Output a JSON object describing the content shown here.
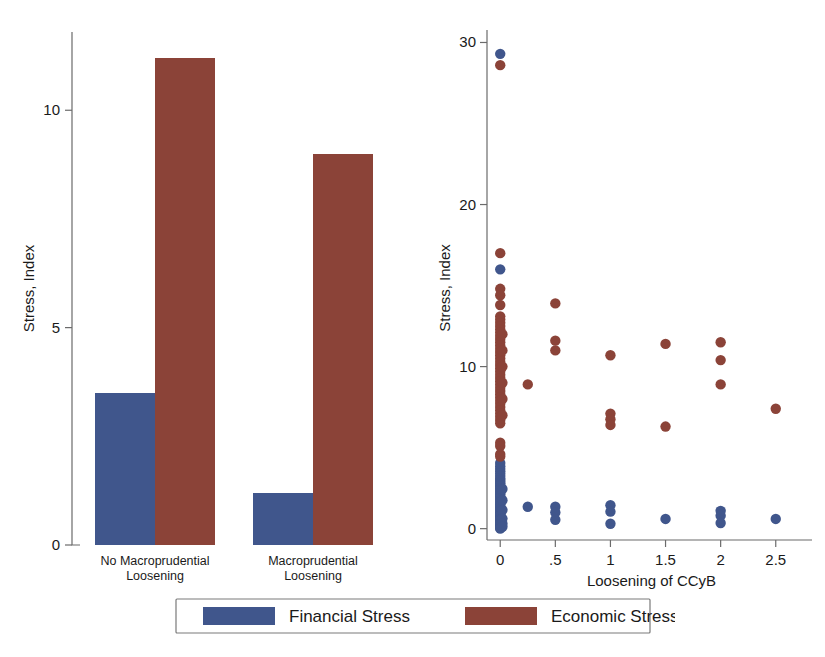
{
  "colors": {
    "financial": "#40568c",
    "economic": "#8b4338",
    "axis": "#6b6b6b",
    "text": "#1a1a1a",
    "background": "#ffffff",
    "legend_border": "#7a7a7a"
  },
  "legend": {
    "position": "bottom-center",
    "entries": [
      {
        "label": "Financial Stress",
        "color": "#40568c",
        "key": "financial"
      },
      {
        "label": "Economic Stress",
        "color": "#8b4338",
        "key": "economic"
      }
    ]
  },
  "chart_data": [
    {
      "id": "bar-panel",
      "type": "bar",
      "title": "",
      "xlabel": "",
      "ylabel": "Stress, Index",
      "categories": [
        "No Macroprudential Loosening",
        "Macroprudential Loosening"
      ],
      "category_lines": [
        [
          "No Macroprudential",
          "Loosening"
        ],
        [
          "Macroprudential",
          "Loosening"
        ]
      ],
      "ylim": [
        0,
        11.8
      ],
      "yticks": [
        0,
        5,
        10
      ],
      "ytick_labels": [
        "0",
        "5",
        "10"
      ],
      "grid": false,
      "legend_position": "bottom-center",
      "series": [
        {
          "name": "Financial Stress",
          "color": "#40568c",
          "values": [
            3.5,
            1.2
          ]
        },
        {
          "name": "Economic Stress",
          "color": "#8b4338",
          "values": [
            11.2,
            9.0
          ]
        }
      ]
    },
    {
      "id": "scatter-panel",
      "type": "scatter",
      "title": "",
      "xlabel": "Loosening of CCyB",
      "ylabel": "Stress, Index",
      "xlim": [
        -0.12,
        2.72
      ],
      "ylim": [
        -0.7,
        30.4
      ],
      "xticks": [
        0,
        0.5,
        1,
        1.5,
        2,
        2.5
      ],
      "xtick_labels": [
        "0",
        ".5",
        "1",
        "1.5",
        "2",
        "2.5"
      ],
      "yticks": [
        0,
        10,
        20,
        30
      ],
      "ytick_labels": [
        "0",
        "10",
        "20",
        "30"
      ],
      "grid": false,
      "legend_position": "bottom-center",
      "series": [
        {
          "name": "Financial Stress",
          "color": "#40568c",
          "points": [
            [
              0,
              29.3
            ],
            [
              0,
              16.0
            ],
            [
              0,
              4.05
            ],
            [
              0,
              3.85
            ],
            [
              0,
              3.7
            ],
            [
              0,
              3.55
            ],
            [
              0,
              3.4
            ],
            [
              0,
              3.25
            ],
            [
              0,
              3.1
            ],
            [
              0,
              3.0
            ],
            [
              0,
              2.9
            ],
            [
              0,
              2.8
            ],
            [
              0,
              2.7
            ],
            [
              0,
              2.6
            ],
            [
              0,
              2.5
            ],
            [
              0,
              2.4
            ],
            [
              0,
              2.3
            ],
            [
              0,
              2.2
            ],
            [
              0,
              2.1
            ],
            [
              0,
              2.0
            ],
            [
              0,
              1.9
            ],
            [
              0,
              1.8
            ],
            [
              0,
              1.7
            ],
            [
              0,
              1.6
            ],
            [
              0,
              1.5
            ],
            [
              0,
              1.4
            ],
            [
              0,
              1.3
            ],
            [
              0,
              1.2
            ],
            [
              0,
              1.1
            ],
            [
              0,
              1.0
            ],
            [
              0,
              0.95
            ],
            [
              0,
              0.9
            ],
            [
              0,
              0.85
            ],
            [
              0,
              0.8
            ],
            [
              0,
              0.75
            ],
            [
              0,
              0.7
            ],
            [
              0,
              0.65
            ],
            [
              0,
              0.6
            ],
            [
              0,
              0.55
            ],
            [
              0,
              0.5
            ],
            [
              0,
              0.45
            ],
            [
              0,
              0.4
            ],
            [
              0,
              0.35
            ],
            [
              0,
              0.3
            ],
            [
              0,
              0.25
            ],
            [
              0,
              0.2
            ],
            [
              0,
              0.15
            ],
            [
              0,
              0.1
            ],
            [
              0,
              0.05
            ],
            [
              0,
              0.0
            ],
            [
              0.02,
              2.45
            ],
            [
              0.02,
              1.75
            ],
            [
              0.02,
              1.15
            ],
            [
              0.02,
              0.62
            ],
            [
              0.02,
              0.32
            ],
            [
              0.02,
              0.12
            ],
            [
              0.25,
              1.35
            ],
            [
              0.5,
              1.35
            ],
            [
              0.5,
              1.0
            ],
            [
              0.5,
              0.55
            ],
            [
              1.0,
              1.45
            ],
            [
              1.0,
              1.05
            ],
            [
              1.0,
              0.3
            ],
            [
              1.5,
              0.6
            ],
            [
              2.0,
              1.1
            ],
            [
              2.0,
              0.8
            ],
            [
              2.0,
              0.35
            ],
            [
              2.5,
              0.6
            ]
          ]
        },
        {
          "name": "Economic Stress",
          "color": "#8b4338",
          "points": [
            [
              0,
              28.6
            ],
            [
              0,
              17.0
            ],
            [
              0,
              14.8
            ],
            [
              0,
              14.4
            ],
            [
              0,
              13.8
            ],
            [
              0,
              13.1
            ],
            [
              0,
              12.9
            ],
            [
              0,
              12.7
            ],
            [
              0,
              12.5
            ],
            [
              0,
              12.3
            ],
            [
              0,
              12.1
            ],
            [
              0,
              11.9
            ],
            [
              0,
              11.7
            ],
            [
              0,
              11.5
            ],
            [
              0,
              11.3
            ],
            [
              0,
              11.1
            ],
            [
              0,
              10.9
            ],
            [
              0,
              10.7
            ],
            [
              0,
              10.5
            ],
            [
              0,
              10.3
            ],
            [
              0,
              10.1
            ],
            [
              0,
              9.9
            ],
            [
              0,
              9.7
            ],
            [
              0,
              9.5
            ],
            [
              0,
              9.3
            ],
            [
              0,
              9.1
            ],
            [
              0,
              8.9
            ],
            [
              0,
              8.7
            ],
            [
              0,
              8.5
            ],
            [
              0,
              8.3
            ],
            [
              0,
              8.1
            ],
            [
              0,
              7.9
            ],
            [
              0,
              7.7
            ],
            [
              0,
              7.5
            ],
            [
              0,
              7.3
            ],
            [
              0,
              7.1
            ],
            [
              0,
              6.9
            ],
            [
              0,
              6.7
            ],
            [
              0,
              6.5
            ],
            [
              0,
              5.3
            ],
            [
              0,
              5.1
            ],
            [
              0,
              4.6
            ],
            [
              0,
              4.45
            ],
            [
              0.02,
              12.0
            ],
            [
              0.02,
              11.0
            ],
            [
              0.02,
              10.0
            ],
            [
              0.02,
              9.0
            ],
            [
              0.02,
              8.0
            ],
            [
              0.02,
              7.0
            ],
            [
              0.25,
              8.9
            ],
            [
              0.5,
              13.9
            ],
            [
              0.5,
              11.6
            ],
            [
              0.5,
              11.0
            ],
            [
              1.0,
              10.7
            ],
            [
              1.0,
              7.1
            ],
            [
              1.0,
              6.75
            ],
            [
              1.0,
              6.4
            ],
            [
              1.5,
              11.4
            ],
            [
              1.5,
              6.3
            ],
            [
              2.0,
              11.5
            ],
            [
              2.0,
              10.4
            ],
            [
              2.0,
              8.9
            ],
            [
              2.5,
              7.4
            ]
          ]
        }
      ]
    }
  ]
}
